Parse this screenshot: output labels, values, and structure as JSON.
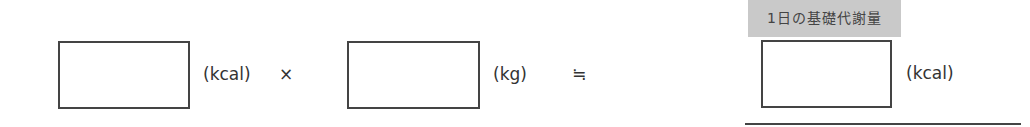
{
  "formula": {
    "factor1": {
      "value": "",
      "unit": "(kcal)"
    },
    "multiply_sign": "×",
    "factor2": {
      "value": "",
      "unit": "(kg)"
    },
    "approx_sign": "≒",
    "result": {
      "label": "1日の基礎代謝量",
      "value": "",
      "unit": "(kcal)"
    }
  }
}
